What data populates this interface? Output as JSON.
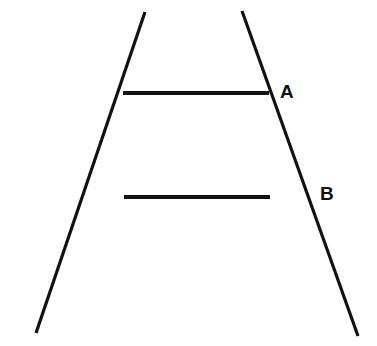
{
  "figure": {
    "background_color": "#ffffff",
    "stroke_color": "#111111",
    "canvas": {
      "width": 377,
      "height": 346
    }
  },
  "labels": {
    "upper": "A",
    "lower": "B"
  },
  "chart_data": {
    "type": "diagram",
    "subtitle": "",
    "xlabel": "",
    "ylabel": "",
    "grid": false,
    "legend": null,
    "xlim": [
      0,
      377
    ],
    "ylim": [
      0,
      346
    ],
    "annotations": [
      {
        "text": "A",
        "x": 287,
        "y": 91
      },
      {
        "text": "B",
        "x": 327,
        "y": 193
      }
    ],
    "series": [
      {
        "name": "left-converging-rail",
        "type": "line",
        "stroke": "#111111",
        "stroke_width": 3.2,
        "points": [
          [
            145,
            12
          ],
          [
            36,
            333
          ]
        ]
      },
      {
        "name": "right-converging-rail",
        "type": "line",
        "stroke": "#111111",
        "stroke_width": 3.2,
        "points": [
          [
            242,
            11
          ],
          [
            358,
            336
          ]
        ]
      },
      {
        "name": "upper-horizontal-bar-A",
        "type": "line",
        "stroke": "#111111",
        "stroke_width": 4,
        "points": [
          [
            123,
            93
          ],
          [
            269,
            93
          ]
        ],
        "length": 146
      },
      {
        "name": "lower-horizontal-bar-B",
        "type": "line",
        "stroke": "#111111",
        "stroke_width": 4,
        "points": [
          [
            124,
            197
          ],
          [
            270,
            197
          ]
        ],
        "length": 146
      }
    ]
  }
}
